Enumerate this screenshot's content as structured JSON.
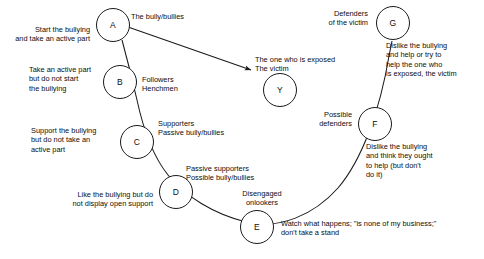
{
  "diagram": {
    "type": "circle-role-diagram",
    "nodes": [
      {
        "id": "A",
        "letter": "A",
        "role": "The bully/bullies",
        "description": "Start the bullying\nand take an active part"
      },
      {
        "id": "B",
        "letter": "B",
        "role": "Followers\nHenchmen",
        "description": "Take an active part\nbut do not start\nthe bullying"
      },
      {
        "id": "C",
        "letter": "C",
        "role": "Supporters\nPassive bully/bullies",
        "description": "Support the bullying\nbut do not take an\nactive part"
      },
      {
        "id": "D",
        "letter": "D",
        "role": "Passive supporters\nPossible bully/bullies",
        "description": "Like the bullying but do\nnot display open support"
      },
      {
        "id": "E",
        "letter": "E",
        "role": "Disengaged\nonlookers",
        "description": "Watch what happens; \"is none of my business;\"\ndon't take a stand"
      },
      {
        "id": "F",
        "letter": "F",
        "role": "Possible\ndefenders",
        "description": "Dislike the bullying\nand think they ought\nto help (but don't\ndo it)"
      },
      {
        "id": "G",
        "letter": "G",
        "role": "Defenders\nof the victim",
        "description": "Dislike the bullying\nand help or try to\nhelp the one who\nis exposed, the victim"
      },
      {
        "id": "Y",
        "letter": "Y",
        "role": "The one who is exposed\nThe victim",
        "description": ""
      }
    ],
    "colors": {
      "stroke": "#1a1a1a",
      "text": "#0d0d0d",
      "background": "#ffffff"
    }
  }
}
